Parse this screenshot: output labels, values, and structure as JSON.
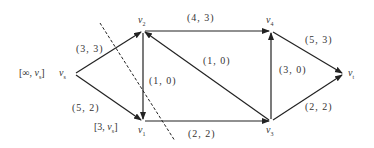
{
  "nodes": {
    "vs": {
      "name": "v",
      "sub": "s",
      "x": 73,
      "y": 74
    },
    "v1": {
      "name": "v",
      "sub": "1",
      "x": 143,
      "y": 121
    },
    "v2": {
      "name": "v",
      "sub": "2",
      "x": 143,
      "y": 31
    },
    "v3": {
      "name": "v",
      "sub": "3",
      "x": 271,
      "y": 121
    },
    "v4": {
      "name": "v",
      "sub": "4",
      "x": 271,
      "y": 31
    },
    "vt": {
      "name": "v",
      "sub": "t",
      "x": 344,
      "y": 74
    }
  },
  "node_labels": {
    "vs": {
      "open": "[∞, ",
      "v": "v",
      "sub": "s",
      "close": "]"
    },
    "v1": {
      "open": "[3, ",
      "v": "v",
      "sub": "s",
      "close": "]"
    }
  },
  "edges": [
    {
      "from": "vs",
      "to": "v2",
      "label": "(3, 3)"
    },
    {
      "from": "vs",
      "to": "v1",
      "label": "(5, 2)"
    },
    {
      "from": "v2",
      "to": "v1",
      "label": "(1, 0)"
    },
    {
      "from": "v2",
      "to": "v4",
      "label": "(4, 3)"
    },
    {
      "from": "v3",
      "to": "v2",
      "label": "(1, 0)"
    },
    {
      "from": "v1",
      "to": "v3",
      "label": "(2, 2)"
    },
    {
      "from": "v3",
      "to": "v4",
      "label": "(3, 0)"
    },
    {
      "from": "v4",
      "to": "vt",
      "label": "(5, 3)"
    },
    {
      "from": "v3",
      "to": "vt",
      "label": "(2, 2)"
    }
  ],
  "cut_line": {
    "x1": 100,
    "y1": 23,
    "x2": 175,
    "y2": 141,
    "style": "dashed"
  },
  "colors": {
    "line": "#222222",
    "text": "#333333",
    "background": "#ffffff"
  }
}
